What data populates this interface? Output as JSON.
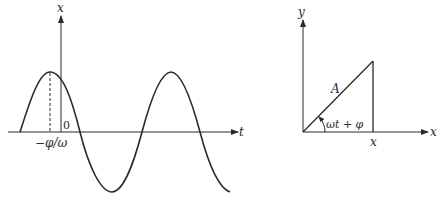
{
  "figure": {
    "left_panel": {
      "title": "Displacement vs time",
      "vertical_axis_label": "x",
      "horizontal_axis_label": "t",
      "origin_label": "0",
      "phase_label": "−φ/ω",
      "curve": "x = A cos(ωt + φ)"
    },
    "right_panel": {
      "title": "Phasor representation",
      "vertical_axis_label": "y",
      "horizontal_axis_label": "x",
      "amplitude_label": "A",
      "angle_label": "ωt + φ",
      "projection_label": "x"
    },
    "colors": {
      "ink": "#2a2a2a",
      "background": "#ffffff"
    }
  }
}
